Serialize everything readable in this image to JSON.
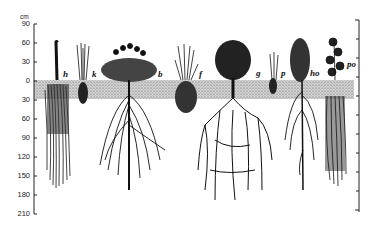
{
  "figure": {
    "unit": "cm",
    "y_axis_ticks": [
      "90",
      "60",
      "30",
      "0",
      "30",
      "60",
      "90",
      "120",
      "150",
      "180",
      "210"
    ],
    "plant_labels": [
      {
        "id": "h",
        "label": "h"
      },
      {
        "id": "k",
        "label": "k"
      },
      {
        "id": "b",
        "label": "b"
      },
      {
        "id": "f",
        "label": "f"
      },
      {
        "id": "g",
        "label": "g"
      },
      {
        "id": "p",
        "label": "p"
      },
      {
        "id": "ho",
        "label": "ho"
      },
      {
        "id": "po",
        "label": "po"
      }
    ],
    "colors": {
      "ink": "#111111",
      "soil": "#b8b8b8",
      "background": "#ffffff"
    }
  }
}
